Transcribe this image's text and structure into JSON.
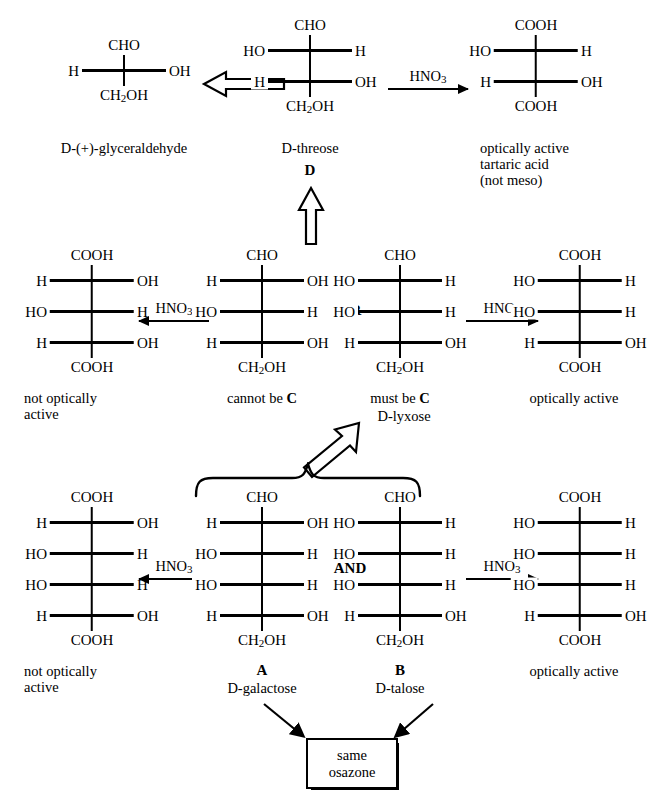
{
  "diagram": {
    "reagent": "HNO3",
    "reagent_formula": {
      "pre": "HNO",
      "sub": "3"
    },
    "connector_or": "OR",
    "connector_and": "AND",
    "osazone_line1": "same",
    "osazone_line2": "osazone"
  },
  "structures": {
    "glyceraldehyde": {
      "top": "CHO",
      "bottom": "CH2OH",
      "bottom_pre": "CH",
      "bottom_sub": "2",
      "bottom_post": "OH",
      "rows": [
        {
          "left": "H",
          "right": "OH"
        }
      ],
      "caption": "D-(+)-glyceraldehyde"
    },
    "threose": {
      "top": "CHO",
      "bottom_pre": "CH",
      "bottom_sub": "2",
      "bottom_post": "OH",
      "rows": [
        {
          "left": "HO",
          "right": "H"
        },
        {
          "left": "H",
          "right": "OH"
        }
      ],
      "caption": "D-threose",
      "label": "D"
    },
    "tartaric_acid": {
      "top": "COOH",
      "bottom": "COOH",
      "rows": [
        {
          "left": "HO",
          "right": "H"
        },
        {
          "left": "H",
          "right": "OH"
        }
      ],
      "caption_l1": "optically active",
      "caption_l2": "tartaric acid",
      "caption_l3": "(not meso)"
    },
    "mid_left_diacid": {
      "top": "COOH",
      "bottom": "COOH",
      "rows": [
        {
          "left": "H",
          "right": "OH"
        },
        {
          "left": "HO",
          "right": "H"
        },
        {
          "left": "H",
          "right": "OH"
        }
      ],
      "caption_l1": "not optically",
      "caption_l2": "active"
    },
    "cannot_be_c": {
      "top": "CHO",
      "bottom_pre": "CH",
      "bottom_sub": "2",
      "bottom_post": "OH",
      "rows": [
        {
          "left": "H",
          "right": "OH"
        },
        {
          "left": "HO",
          "right": "H"
        },
        {
          "left": "H",
          "right": "OH"
        }
      ],
      "caption_pre": "cannot be ",
      "caption_bold": "C"
    },
    "lyxose": {
      "top": "CHO",
      "bottom_pre": "CH",
      "bottom_sub": "2",
      "bottom_post": "OH",
      "rows": [
        {
          "left": "HO",
          "right": "H"
        },
        {
          "left": "HO",
          "right": "H"
        },
        {
          "left": "H",
          "right": "OH"
        }
      ],
      "caption_pre": "must be ",
      "caption_bold": "C",
      "caption_l2": "D-lyxose"
    },
    "mid_right_diacid": {
      "top": "COOH",
      "bottom": "COOH",
      "rows": [
        {
          "left": "HO",
          "right": "H"
        },
        {
          "left": "HO",
          "right": "H"
        },
        {
          "left": "H",
          "right": "OH"
        }
      ],
      "caption_l1": "optically active"
    },
    "bot_left_diacid": {
      "top": "COOH",
      "bottom": "COOH",
      "rows": [
        {
          "left": "H",
          "right": "OH"
        },
        {
          "left": "HO",
          "right": "H"
        },
        {
          "left": "HO",
          "right": "H"
        },
        {
          "left": "H",
          "right": "OH"
        }
      ],
      "caption_l1": "not optically",
      "caption_l2": "active"
    },
    "galactose": {
      "top": "CHO",
      "bottom_pre": "CH",
      "bottom_sub": "2",
      "bottom_post": "OH",
      "rows": [
        {
          "left": "H",
          "right": "OH"
        },
        {
          "left": "HO",
          "right": "H"
        },
        {
          "left": "HO",
          "right": "H"
        },
        {
          "left": "H",
          "right": "OH"
        }
      ],
      "label": "A",
      "caption_l2": "D-galactose"
    },
    "talose": {
      "top": "CHO",
      "bottom_pre": "CH",
      "bottom_sub": "2",
      "bottom_post": "OH",
      "rows": [
        {
          "left": "HO",
          "right": "H"
        },
        {
          "left": "HO",
          "right": "H"
        },
        {
          "left": "HO",
          "right": "H"
        },
        {
          "left": "H",
          "right": "OH"
        }
      ],
      "label": "B",
      "caption_l2": "D-talose"
    },
    "bot_right_diacid": {
      "top": "COOH",
      "bottom": "COOH",
      "rows": [
        {
          "left": "HO",
          "right": "H"
        },
        {
          "left": "HO",
          "right": "H"
        },
        {
          "left": "HO",
          "right": "H"
        },
        {
          "left": "H",
          "right": "OH"
        }
      ],
      "caption_l1": "optically active"
    }
  },
  "colors": {
    "ink": "#000000",
    "paper": "#ffffff"
  }
}
